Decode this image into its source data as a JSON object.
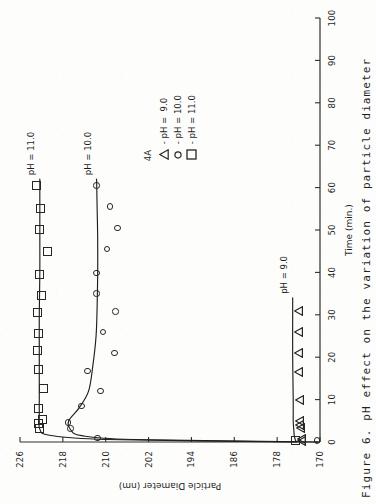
{
  "figure": {
    "caption": "Figure 6.   pH effect on the variation of particle diameter"
  },
  "legend": {
    "title": "4A",
    "entries": [
      {
        "marker": "triangle-marker",
        "label": "- pH =  9.0"
      },
      {
        "marker": "circle-marker",
        "label": "- pH = 10.0"
      },
      {
        "marker": "square-marker",
        "label": "- pH = 11.0"
      }
    ]
  },
  "annotations": {
    "ph11": "pH = 11.0",
    "ph10": "pH = 10.0",
    "ph9": "pH = 9.0"
  },
  "chart_data": {
    "type": "scatter",
    "title": "",
    "xlabel": "Time (min.)",
    "ylabel": "Particle Diameter (nm)",
    "xlim": [
      0,
      100
    ],
    "ylim": [
      170,
      226
    ],
    "xticks": [
      0,
      10,
      20,
      30,
      40,
      50,
      60,
      70,
      80,
      90,
      100
    ],
    "yticks": [
      170,
      178,
      186,
      194,
      202,
      210,
      218,
      226
    ],
    "xtick_labels": [
      "0",
      "10",
      "20",
      "30",
      "40",
      "50",
      "60",
      "70",
      "80",
      "90",
      "100"
    ],
    "ytick_labels": [
      "170",
      "178",
      "186",
      "194",
      "202",
      "210",
      "218",
      "226"
    ],
    "grid": false,
    "legend_position": "center-right",
    "series": [
      {
        "name": "pH = 9.0",
        "marker": "triangle",
        "x": [
          0.3,
          0.8,
          3.2,
          4.0,
          5.0,
          10.0,
          16.5,
          21.0,
          26.0,
          31.0
        ],
        "y": [
          174.6,
          174.6,
          174.8,
          174.9,
          174.9,
          175.0,
          175.1,
          175.1,
          175.1,
          175.1
        ],
        "line_x": [
          0,
          0.5,
          1.5,
          3,
          5,
          10,
          20,
          30,
          34
        ],
        "line_y": [
          174.4,
          174.6,
          174.8,
          174.9,
          175.0,
          175.0,
          175.1,
          175.1,
          175.1
        ]
      },
      {
        "name": "pH = 10.0",
        "marker": "circle",
        "x": [
          0.4,
          1.0,
          3.2,
          4.6,
          8.5,
          12.0,
          16.8,
          21.0,
          26.0,
          30.8,
          35.0,
          39.8,
          45.5,
          50.5,
          55.5,
          60.5
        ],
        "y": [
          170.6,
          211.5,
          216.6,
          217.0,
          214.5,
          211.0,
          213.4,
          208.4,
          210.5,
          208.2,
          211.7,
          211.7,
          209.8,
          207.8,
          209.2,
          211.7
        ],
        "line_x": [
          0,
          0.6,
          1.5,
          3,
          5,
          8,
          12,
          18,
          25,
          32,
          40,
          48,
          55,
          62
        ],
        "line_y": [
          170.5,
          205.0,
          214.5,
          216.6,
          216.9,
          215.0,
          213.2,
          212.4,
          211.8,
          211.6,
          211.5,
          211.5,
          211.6,
          211.7
        ]
      },
      {
        "name": "pH = 11.0",
        "marker": "square",
        "x": [
          0.4,
          3.2,
          4.3,
          5.3,
          8.0,
          12.5,
          17.0,
          21.5,
          25.5,
          30.5,
          34.5,
          39.5,
          45.0,
          50.0,
          55.0,
          60.5
        ],
        "y": [
          174.6,
          222.4,
          222.6,
          221.8,
          222.6,
          221.7,
          222.5,
          222.7,
          222.5,
          222.8,
          221.9,
          222.4,
          220.9,
          222.4,
          222.2,
          223.0
        ],
        "line_x": [
          0,
          0.6,
          1.6,
          3,
          5,
          10,
          20,
          30,
          40,
          50,
          62
        ],
        "line_y": [
          174.5,
          210.0,
          220.5,
          222.3,
          222.4,
          222.4,
          222.4,
          222.4,
          222.3,
          222.3,
          222.3
        ]
      }
    ]
  }
}
